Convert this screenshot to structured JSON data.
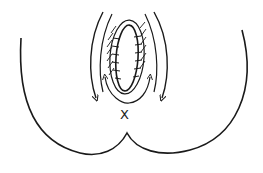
{
  "diagram": {
    "type": "anatomical-sketch",
    "stroke_color": "#1a1a1a",
    "background": "#ffffff",
    "elements": [
      {
        "name": "outer-contour",
        "kind": "curve"
      },
      {
        "name": "incision-ellipse",
        "kind": "ellipse"
      },
      {
        "name": "sutures",
        "kind": "tick-marks"
      },
      {
        "name": "hatching",
        "kind": "shading"
      },
      {
        "name": "outer-arrows",
        "kind": "arrows",
        "count": 2,
        "direction": "down"
      },
      {
        "name": "inner-arrows",
        "kind": "arrows",
        "count": 2,
        "direction": "up-outward"
      }
    ],
    "mark_label": "X"
  }
}
